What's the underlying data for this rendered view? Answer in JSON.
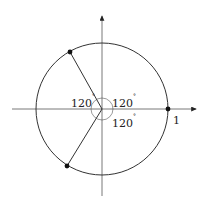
{
  "diagram": {
    "title": "",
    "colors": {
      "stroke": "#333333",
      "axis": "#555555",
      "point": "#111111"
    },
    "angles": [
      {
        "value": "120",
        "unit": "°",
        "position": "upper-left"
      },
      {
        "value": "120",
        "unit": "°",
        "position": "upper-right"
      },
      {
        "value": "120",
        "unit": "°",
        "position": "lower-right"
      }
    ],
    "unit_label": "1",
    "points": [
      {
        "name": "point-right",
        "angle_deg": 0
      },
      {
        "name": "point-upper-left",
        "angle_deg": 120
      },
      {
        "name": "point-lower-left",
        "angle_deg": 240
      }
    ]
  }
}
